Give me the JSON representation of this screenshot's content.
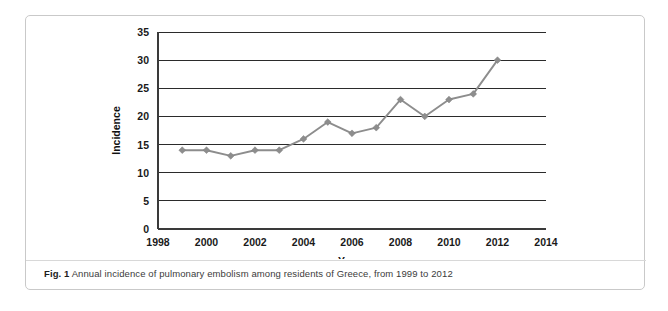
{
  "figure": {
    "caption_lead": "Fig. 1",
    "caption_text": "Annual incidence of pulmonary embolism among residents of Greece, from 1999 to 2012"
  },
  "chart_data": {
    "type": "line",
    "title": "",
    "xlabel": "Years",
    "ylabel": "Incidence",
    "x": [
      1999,
      2000,
      2001,
      2002,
      2003,
      2004,
      2005,
      2006,
      2007,
      2008,
      2009,
      2010,
      2011,
      2012
    ],
    "values": [
      14,
      14,
      13,
      14,
      14,
      16,
      19,
      17,
      18,
      23,
      20,
      23,
      24,
      30
    ],
    "series": [
      {
        "name": "Incidence",
        "values": [
          14,
          14,
          13,
          14,
          14,
          16,
          19,
          17,
          18,
          23,
          20,
          23,
          24,
          30
        ],
        "color": "#8d8d8d",
        "marker": "diamond"
      }
    ],
    "xlim": [
      1998,
      2014
    ],
    "ylim": [
      0,
      35
    ],
    "xticks": [
      1998,
      2000,
      2002,
      2004,
      2006,
      2008,
      2010,
      2012,
      2014
    ],
    "xtick_labels": [
      "1998",
      "2000",
      "2002",
      "2004",
      "2006",
      "2008",
      "2010",
      "2012",
      "2014"
    ],
    "yticks": [
      0,
      5,
      10,
      15,
      20,
      25,
      30,
      35
    ],
    "ytick_labels": [
      "0",
      "5",
      "10",
      "15",
      "20",
      "25",
      "30",
      "35"
    ],
    "grid": "horizontal",
    "legend": "none"
  }
}
